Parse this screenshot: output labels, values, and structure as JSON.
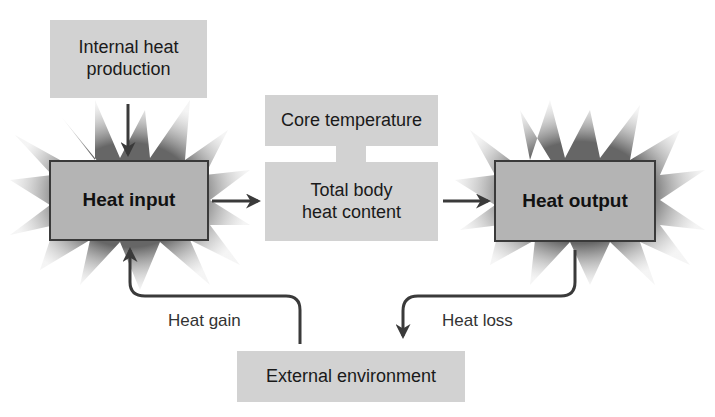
{
  "diagram": {
    "internal_heat": "Internal heat production",
    "internal_heat_lines": [
      "Internal heat",
      "production"
    ],
    "heat_input": "Heat input",
    "core_temperature": "Core temperature",
    "total_body_lines": [
      "Total body",
      "heat content"
    ],
    "heat_output": "Heat output",
    "external_environment": "External environment",
    "heat_gain": "Heat gain",
    "heat_loss": "Heat loss"
  },
  "colors": {
    "box_light": "#d2d2d2",
    "box_dark": "#b4b4b4",
    "arrow": "#3a3a3a"
  }
}
